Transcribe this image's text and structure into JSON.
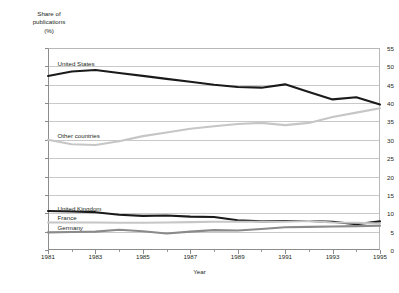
{
  "chart_data": {
    "type": "line",
    "title": "",
    "xlabel": "Year",
    "ylabel": "Share of publications (%)",
    "ylabel_lines": "Share of\npublications\n(%)",
    "x": [
      1981,
      1982,
      1983,
      1984,
      1985,
      1986,
      1987,
      1988,
      1989,
      1990,
      1991,
      1992,
      1993,
      1994,
      1995
    ],
    "xlim": [
      1981,
      1995
    ],
    "ylim": [
      0,
      55
    ],
    "yticks": [
      0,
      5,
      10,
      15,
      20,
      25,
      30,
      35,
      40,
      45,
      50,
      55
    ],
    "xticks_major": [
      1981,
      1983,
      1985,
      1987,
      1989,
      1991,
      1993,
      1995
    ],
    "xticks_minor": [
      1982,
      1984,
      1986,
      1988,
      1990,
      1992,
      1994
    ],
    "grid": "horizontal",
    "legend": "inline-labels",
    "series": [
      {
        "name": "United States",
        "color": "#1a1a1a",
        "width": 2.1,
        "label_x": 1981.4,
        "label_y": 50.6,
        "values": [
          47.4,
          48.6,
          49.0,
          48.2,
          47.4,
          46.6,
          45.8,
          45.0,
          44.4,
          44.2,
          45.1,
          43.0,
          41.0,
          41.6,
          39.6
        ]
      },
      {
        "name": "Other countries",
        "color": "#c6c6c6",
        "width": 2.1,
        "label_x": 1981.4,
        "label_y": 31.0,
        "values": [
          30.0,
          28.8,
          28.6,
          29.6,
          31.0,
          32.0,
          33.0,
          33.7,
          34.3,
          34.6,
          34.0,
          34.6,
          36.2,
          37.4,
          38.6
        ]
      },
      {
        "name": "United Kingdom",
        "color": "#1a1a1a",
        "width": 2.1,
        "label_x": 1981.4,
        "label_y": 11.2,
        "values": [
          10.6,
          10.5,
          10.3,
          9.6,
          9.3,
          9.4,
          9.1,
          9.0,
          8.1,
          7.8,
          7.9,
          7.9,
          7.7,
          7.0,
          7.8
        ]
      },
      {
        "name": "France",
        "color": "#c6c6c6",
        "width": 2.1,
        "label_x": 1981.4,
        "label_y": 8.6,
        "values": [
          7.5,
          7.5,
          7.5,
          7.4,
          7.4,
          7.5,
          7.6,
          7.7,
          7.7,
          7.7,
          7.7,
          7.9,
          7.5,
          7.4,
          7.2
        ]
      },
      {
        "name": "Germany",
        "color": "#8a8a8a",
        "width": 2.1,
        "label_x": 1981.4,
        "label_y": 6.0,
        "values": [
          4.8,
          4.9,
          5.0,
          5.5,
          5.1,
          4.5,
          5.0,
          5.4,
          5.3,
          5.7,
          6.2,
          6.3,
          6.4,
          6.5,
          6.6
        ]
      }
    ]
  }
}
